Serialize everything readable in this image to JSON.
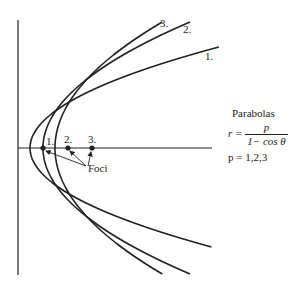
{
  "chart_data": {
    "type": "line",
    "title": "Parabolas",
    "formula": "r = p / (1 - cos θ)",
    "parameter_values": "p = 1,2,3",
    "series": [
      {
        "name": "1.",
        "p": 1
      },
      {
        "name": "2.",
        "p": 2
      },
      {
        "name": "3.",
        "p": 3
      }
    ],
    "foci_labels": [
      "1.",
      "2.",
      "3."
    ],
    "foci_annotation": "Foci",
    "xlabel": "",
    "ylabel": ""
  },
  "caption": {
    "title": "Parabolas",
    "formula_lhs": "r =",
    "formula_num": "p",
    "formula_den": "1− cos θ",
    "params": "p = 1,2,3"
  },
  "labels": {
    "curve1": "1.",
    "curve2": "2.",
    "curve3": "3.",
    "focus1": "1.",
    "focus2": "2.",
    "focus3": "3.",
    "foci": "Foci"
  },
  "colors": {
    "ink": "#222222",
    "background": "#ffffff"
  }
}
